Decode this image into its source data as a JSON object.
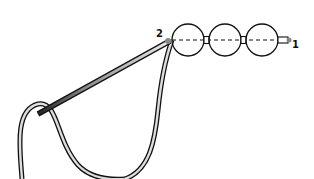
{
  "diagram": {
    "type": "beading-stitch-illustration",
    "labels": {
      "start": "1",
      "needle_exit": "2"
    },
    "beads": {
      "large_count": 3,
      "small_count": 2
    },
    "colors": {
      "stroke": "#111111",
      "thread_fill": "#dddddd",
      "needle_dark": "#333333",
      "background": "#ffffff"
    }
  }
}
